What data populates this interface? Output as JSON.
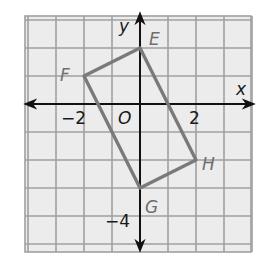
{
  "diagram": {
    "type": "coordinate-plane",
    "grid": {
      "x_min": -4,
      "x_max": 4,
      "y_min": -5,
      "y_max": 3,
      "unit_px": 28,
      "origin_px": [
        140,
        104
      ],
      "background": "#ececec",
      "line_color": "#9e9e9e"
    },
    "axes": {
      "x_label": "x",
      "y_label": "y",
      "origin_label": "O",
      "color": "#111111"
    },
    "ticks": {
      "x_neg": "−2",
      "x_pos": "2",
      "y_neg": "−4"
    },
    "polygon": {
      "color": "#7a7a7a",
      "vertices": [
        {
          "label": "E",
          "x": 0,
          "y": 2
        },
        {
          "label": "H",
          "x": 2,
          "y": -2
        },
        {
          "label": "G",
          "x": 0,
          "y": -3
        },
        {
          "label": "F",
          "x": -2,
          "y": 1
        }
      ]
    }
  }
}
